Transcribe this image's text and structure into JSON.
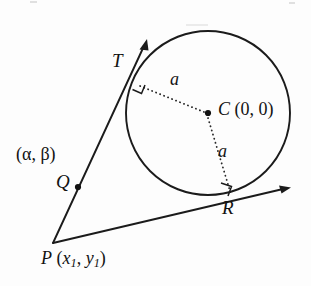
{
  "figure": {
    "background_color": "#fdfdfd",
    "ink_color": "#1b1b1b"
  },
  "labels": {
    "tangent_point_top": "T",
    "tangent_point_right": "R",
    "center": "C",
    "center_coords": "(0, 0)",
    "external_point": "P",
    "external_coords_open": "(",
    "external_x": "x",
    "external_x_sub": "1",
    "external_comma": ", ",
    "external_y": "y",
    "external_y_sub": "1",
    "external_coords_close": ")",
    "midpoint": "Q",
    "midpoint_coords": "(α, β)",
    "radius_upper": "a",
    "radius_lower": "a"
  },
  "geometry": {
    "circle": {
      "cx": 208,
      "cy": 113,
      "r": 82
    },
    "points": {
      "T": {
        "x": 136,
        "y": 84
      },
      "R": {
        "x": 231,
        "y": 196
      },
      "C": {
        "x": 208,
        "y": 113
      },
      "P": {
        "x": 53,
        "y": 243
      },
      "Q": {
        "x": 78,
        "y": 187
      }
    },
    "tangent_line_T": {
      "from_x": 53,
      "from_y": 243,
      "to_x": 147,
      "to_y": 40
    },
    "tangent_line_R": {
      "from_x": 53,
      "from_y": 243,
      "to_x": 290,
      "to_y": 188
    },
    "radius_CT": {
      "x1": 208,
      "y1": 113,
      "x2": 136,
      "y2": 84
    },
    "radius_CR": {
      "x1": 208,
      "y1": 113,
      "x2": 231,
      "y2": 196
    },
    "right_angle_marks": [
      "T",
      "R"
    ],
    "marked_dots": [
      "C",
      "Q"
    ],
    "arrow_heads": [
      "tangent-T-tip",
      "tangent-R-tip"
    ]
  }
}
